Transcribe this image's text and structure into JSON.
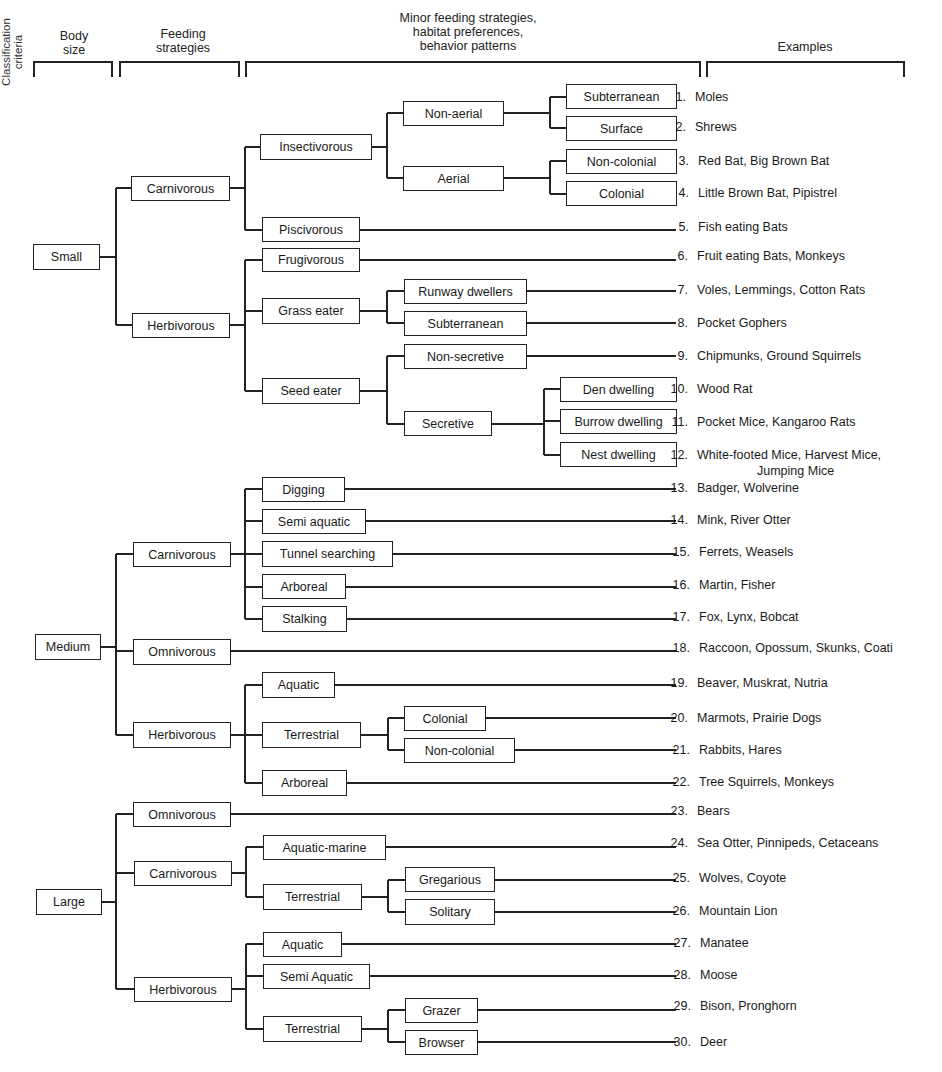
{
  "headers": {
    "classification_criteria": "Classification criteria",
    "body_size": [
      "Body",
      "size"
    ],
    "feeding_strategies": [
      "Feeding",
      "strategies"
    ],
    "minor": [
      "Minor feeding strategies,",
      "habitat preferences,",
      "behavior patterns"
    ],
    "examples": "Examples"
  },
  "tree": {
    "small": {
      "label": "Small",
      "carnivorous": {
        "label": "Carnivorous",
        "insectivorous": {
          "label": "Insectivorous",
          "non_aerial": {
            "label": "Non-aerial",
            "subterranean": "Subterranean",
            "surface": "Surface"
          },
          "aerial": {
            "label": "Aerial",
            "non_colonial": "Non-colonial",
            "colonial": "Colonial"
          }
        },
        "piscivorous": "Piscivorous"
      },
      "herbivorous": {
        "label": "Herbivorous",
        "frugivorous": "Frugivorous",
        "grass_eater": {
          "label": "Grass eater",
          "runway": "Runway dwellers",
          "subterranean": "Subterranean"
        },
        "seed_eater": {
          "label": "Seed eater",
          "non_secretive": "Non-secretive",
          "secretive": {
            "label": "Secretive",
            "den": "Den dwelling",
            "burrow": "Burrow dwelling",
            "nest": "Nest dwelling"
          }
        }
      }
    },
    "medium": {
      "label": "Medium",
      "carnivorous": {
        "label": "Carnivorous",
        "digging": "Digging",
        "semi_aquatic": "Semi aquatic",
        "tunnel": "Tunnel searching",
        "arboreal": "Arboreal",
        "stalking": "Stalking"
      },
      "omnivorous": "Omnivorous",
      "herbivorous": {
        "label": "Herbivorous",
        "aquatic": "Aquatic",
        "terrestrial": {
          "label": "Terrestrial",
          "colonial": "Colonial",
          "non_colonial": "Non-colonial"
        },
        "arboreal": "Arboreal"
      }
    },
    "large": {
      "label": "Large",
      "omnivorous": "Omnivorous",
      "carnivorous": {
        "label": "Carnivorous",
        "aquatic_marine": "Aquatic-marine",
        "terrestrial": {
          "label": "Terrestrial",
          "gregarious": "Gregarious",
          "solitary": "Solitary"
        }
      },
      "herbivorous": {
        "label": "Herbivorous",
        "aquatic": "Aquatic",
        "semi_aquatic": "Semi Aquatic",
        "terrestrial": {
          "label": "Terrestrial",
          "grazer": "Grazer",
          "browser": "Browser"
        }
      }
    }
  },
  "examples": [
    {
      "num": "1.",
      "text": "Moles"
    },
    {
      "num": "2.",
      "text": "Shrews"
    },
    {
      "num": "3.",
      "text": "Red Bat, Big Brown Bat"
    },
    {
      "num": "4.",
      "text": "Little Brown Bat, Pipistrel"
    },
    {
      "num": "5.",
      "text": "Fish eating Bats"
    },
    {
      "num": "6.",
      "text": "Fruit eating Bats, Monkeys"
    },
    {
      "num": "7.",
      "text": "Voles, Lemmings, Cotton Rats"
    },
    {
      "num": "8.",
      "text": "Pocket Gophers"
    },
    {
      "num": "9.",
      "text": "Chipmunks, Ground Squirrels"
    },
    {
      "num": "10.",
      "text": "Wood Rat"
    },
    {
      "num": "11.",
      "text": "Pocket Mice, Kangaroo Rats"
    },
    {
      "num": "12.",
      "text": "White-footed Mice, Harvest Mice,",
      "text2": "Jumping Mice"
    },
    {
      "num": "13.",
      "text": "Badger, Wolverine"
    },
    {
      "num": "14.",
      "text": "Mink, River Otter"
    },
    {
      "num": "15.",
      "text": "Ferrets, Weasels"
    },
    {
      "num": "16.",
      "text": "Martin, Fisher"
    },
    {
      "num": "17.",
      "text": "Fox, Lynx, Bobcat"
    },
    {
      "num": "18.",
      "text": "Raccoon, Opossum, Skunks, Coati"
    },
    {
      "num": "19.",
      "text": "Beaver, Muskrat, Nutria"
    },
    {
      "num": "20.",
      "text": "Marmots, Prairie Dogs"
    },
    {
      "num": "21.",
      "text": "Rabbits, Hares"
    },
    {
      "num": "22.",
      "text": "Tree Squirrels, Monkeys"
    },
    {
      "num": "23.",
      "text": "Bears"
    },
    {
      "num": "24.",
      "text": "Sea Otter, Pinnipeds, Cetaceans"
    },
    {
      "num": "25.",
      "text": "Wolves, Coyote"
    },
    {
      "num": "26.",
      "text": "Mountain Lion"
    },
    {
      "num": "27.",
      "text": "Manatee"
    },
    {
      "num": "28.",
      "text": "Moose"
    },
    {
      "num": "29.",
      "text": "Bison, Pronghorn"
    },
    {
      "num": "30.",
      "text": "Deer"
    }
  ]
}
